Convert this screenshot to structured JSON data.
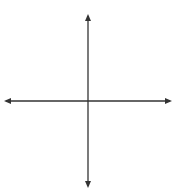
{
  "diagram": {
    "type": "coordinate-plane",
    "x_axis": {
      "label": "x",
      "range": [
        -5,
        5
      ],
      "tick_labels": [
        "-4",
        "-3",
        "-2",
        "-1",
        "1",
        "2",
        "3",
        "4"
      ],
      "tick_values": [
        -4,
        -3,
        -2,
        -1,
        1,
        2,
        3,
        4
      ]
    },
    "y_axis": {
      "label": "y",
      "range": [
        -5,
        5
      ],
      "tick_labels": [
        "4",
        "3",
        "2",
        "1",
        "-2",
        "-3",
        "-4"
      ],
      "tick_values": [
        4,
        3,
        2,
        1,
        -2,
        -3,
        -4
      ]
    },
    "grid": true,
    "colors": {
      "grid": "#a9d4ea",
      "axis": "#333333",
      "triangle_orange": "#e8572a",
      "triangle_blue": "#3f6fa8"
    },
    "shapes": [
      {
        "name": "orange-triangle",
        "color": "#e8572a",
        "vertices": [
          [
            -4,
            4
          ],
          [
            -4,
            1
          ],
          [
            -2,
            1
          ]
        ]
      },
      {
        "name": "blue-triangle",
        "color": "#3f6fa8",
        "vertices": [
          [
            2,
            -1
          ],
          [
            2,
            -4
          ],
          [
            4,
            -4
          ]
        ]
      }
    ]
  },
  "labels": {
    "x_axis": "x",
    "y_axis": "y",
    "x_ticks": {
      "n4": "−4",
      "n3": "−3",
      "n2": "−2",
      "n1": "−1",
      "p1": "1",
      "p2": "2",
      "p3": "3",
      "p4": "4"
    },
    "y_ticks": {
      "p4": "4",
      "p3": "3",
      "p2": "2",
      "p1": "1",
      "n2": "−2",
      "n3": "−3",
      "n4": "−4"
    }
  }
}
